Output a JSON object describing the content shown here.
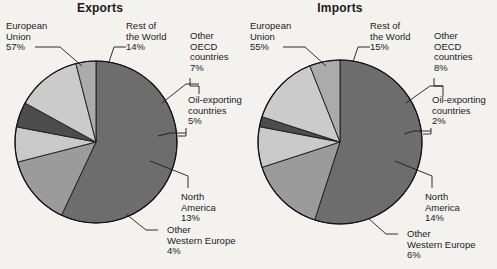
{
  "chart_data": [
    {
      "type": "pie",
      "title": "Exports",
      "xlabel": "",
      "ylabel": "",
      "legend": "callout-labels",
      "grid": false,
      "categories": [
        "European Union",
        "Rest of the World",
        "Other OECD countries",
        "Oil-exporting countries",
        "North America",
        "Other Western Europe"
      ],
      "values": [
        57,
        14,
        7,
        5,
        13,
        4
      ],
      "value_labels": [
        "57%",
        "14%",
        "7%",
        "5%",
        "13%",
        "4%"
      ],
      "colors": [
        "#6d6d6d",
        "#9b9b9b",
        "#c9c9c9",
        "#4c4c4c",
        "#cbcbcb",
        "#ababab"
      ]
    },
    {
      "type": "pie",
      "title": "Imports",
      "xlabel": "",
      "ylabel": "",
      "legend": "callout-labels",
      "grid": false,
      "categories": [
        "European Union",
        "Rest of the World",
        "Other OECD countries",
        "Oil-exporting countries",
        "North America",
        "Other Western Europe"
      ],
      "values": [
        55,
        15,
        8,
        2,
        14,
        6
      ],
      "value_labels": [
        "55%",
        "15%",
        "8%",
        "2%",
        "14%",
        "6%"
      ],
      "colors": [
        "#6d6d6d",
        "#9b9b9b",
        "#c9c9c9",
        "#4c4c4c",
        "#cbcbcb",
        "#ababab"
      ]
    }
  ],
  "exports": {
    "title": "Exports",
    "labels": {
      "eu": {
        "l1": "European",
        "l2": "Union",
        "l3": "57%"
      },
      "row": {
        "l1": "Rest of",
        "l2": "the World",
        "l3": "14%"
      },
      "oecd": {
        "l1": "Other",
        "l2": "OECD",
        "l3": "countries",
        "l4": "7%"
      },
      "oil": {
        "l1": "Oil-exporting",
        "l2": "countries",
        "l3": "5%"
      },
      "na": {
        "l1": "North",
        "l2": "America",
        "l3": "13%"
      },
      "owe": {
        "l1": "Other",
        "l2": "Western Europe",
        "l3": "4%"
      }
    }
  },
  "imports": {
    "title": "Imports",
    "labels": {
      "eu": {
        "l1": "European",
        "l2": "Union",
        "l3": "55%"
      },
      "row": {
        "l1": "Rest of",
        "l2": "the World",
        "l3": "15%"
      },
      "oecd": {
        "l1": "Other",
        "l2": "OECD",
        "l3": "countries",
        "l4": "8%"
      },
      "oil": {
        "l1": "Oil-exporting",
        "l2": "countries",
        "l3": "2%"
      },
      "na": {
        "l1": "North",
        "l2": "America",
        "l3": "14%"
      },
      "owe": {
        "l1": "Other",
        "l2": "Western Europe",
        "l3": "6%"
      }
    }
  }
}
